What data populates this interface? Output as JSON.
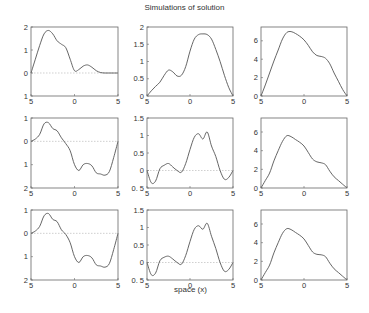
{
  "figure": {
    "title": "Simulations of solution",
    "xlabel": "space (x)",
    "line_color": "#555555",
    "axis_color": "#666666",
    "zero_line_color": "#bbbbbb"
  },
  "chart_data": [
    {
      "type": "line",
      "row": 0,
      "col": 0,
      "xlim": [
        -5,
        5
      ],
      "ylim": [
        -1,
        2
      ],
      "xticks": [
        -5,
        0,
        5
      ],
      "xtick_labels": [
        "5",
        "0",
        "5"
      ],
      "yticks": [
        -1,
        0,
        1,
        2
      ],
      "ytick_labels": [
        "1",
        "0",
        "1",
        "2"
      ],
      "zero_line": true,
      "x": [
        -5,
        -4.5,
        -4,
        -3.5,
        -3,
        -2.5,
        -2,
        -1.5,
        -1,
        -0.5,
        0,
        0.5,
        1,
        1.5,
        2,
        2.5,
        3,
        3.5,
        4,
        4.5,
        5
      ],
      "y": [
        0.0,
        0.6,
        1.2,
        1.7,
        1.85,
        1.7,
        1.4,
        1.25,
        1.1,
        0.6,
        0.1,
        0.15,
        0.3,
        0.35,
        0.25,
        0.1,
        0.02,
        0.0,
        0.0,
        0.0,
        0.0
      ]
    },
    {
      "type": "line",
      "row": 0,
      "col": 1,
      "xlim": [
        -5,
        5
      ],
      "ylim": [
        0,
        2
      ],
      "xticks": [
        -5,
        0,
        5
      ],
      "xtick_labels": [
        "5",
        "0",
        "5"
      ],
      "yticks": [
        0,
        0.5,
        1,
        1.5,
        2
      ],
      "ytick_labels": [
        "0",
        "0.5",
        "1",
        "1.5",
        "2"
      ],
      "zero_line": false,
      "x": [
        -5,
        -4.5,
        -4,
        -3.5,
        -3,
        -2.5,
        -2,
        -1.5,
        -1,
        -0.5,
        0,
        0.5,
        1,
        1.5,
        2,
        2.5,
        3,
        3.5,
        4,
        4.5,
        5
      ],
      "y": [
        0.0,
        0.15,
        0.28,
        0.4,
        0.6,
        0.75,
        0.7,
        0.58,
        0.6,
        0.85,
        1.3,
        1.65,
        1.78,
        1.8,
        1.78,
        1.65,
        1.35,
        1.0,
        0.6,
        0.25,
        0.0
      ]
    },
    {
      "type": "line",
      "row": 0,
      "col": 2,
      "xlim": [
        -5,
        5
      ],
      "ylim": [
        0,
        7.5
      ],
      "xticks": [
        -5,
        0,
        5
      ],
      "xtick_labels": [
        "5",
        "0",
        "5"
      ],
      "yticks": [
        0,
        2,
        4,
        6
      ],
      "ytick_labels": [
        "0",
        "2",
        "4",
        "6"
      ],
      "zero_line": false,
      "x": [
        -5,
        -4.5,
        -4,
        -3.5,
        -3,
        -2.5,
        -2,
        -1.5,
        -1,
        -0.5,
        0,
        0.5,
        1,
        1.5,
        2,
        2.5,
        3,
        3.5,
        4,
        4.5,
        5
      ],
      "y": [
        0.0,
        1.2,
        2.5,
        3.8,
        5.0,
        6.2,
        6.9,
        7.0,
        6.8,
        6.5,
        6.1,
        5.5,
        4.8,
        4.4,
        4.3,
        4.1,
        3.5,
        2.5,
        1.6,
        0.7,
        0.0
      ]
    },
    {
      "type": "line",
      "row": 1,
      "col": 0,
      "xlim": [
        -5,
        5
      ],
      "ylim": [
        -2,
        1
      ],
      "xticks": [
        -5,
        0,
        5
      ],
      "xtick_labels": [
        "5",
        "0",
        "5"
      ],
      "yticks": [
        -2,
        -1,
        0,
        1
      ],
      "ytick_labels": [
        "2",
        "1",
        "0",
        "1"
      ],
      "zero_line": true,
      "x": [
        -5,
        -4.5,
        -4,
        -3.5,
        -3,
        -2.5,
        -2,
        -1.5,
        -1,
        -0.5,
        0,
        0.5,
        1,
        1.5,
        2,
        2.5,
        3,
        3.5,
        4,
        4.5,
        5
      ],
      "y": [
        0.0,
        0.1,
        0.3,
        0.75,
        0.8,
        0.55,
        0.45,
        0.15,
        -0.1,
        -0.4,
        -1.0,
        -1.25,
        -1.0,
        -0.95,
        -1.05,
        -1.35,
        -1.4,
        -1.45,
        -1.3,
        -0.7,
        0.0
      ]
    },
    {
      "type": "line",
      "row": 1,
      "col": 1,
      "xlim": [
        -5,
        5
      ],
      "ylim": [
        -0.5,
        1.5
      ],
      "xticks": [
        -5,
        0,
        5
      ],
      "xtick_labels": [
        "5",
        "0",
        "5"
      ],
      "yticks": [
        -0.5,
        0,
        0.5,
        1,
        1.5
      ],
      "ytick_labels": [
        "0. 5",
        "0",
        "0.5",
        "1",
        "1.5"
      ],
      "zero_line": true,
      "x": [
        -5,
        -4.5,
        -4,
        -3.5,
        -3,
        -2.5,
        -2,
        -1.5,
        -1,
        -0.5,
        0,
        0.5,
        1,
        1.5,
        2,
        2.5,
        3,
        3.5,
        4,
        4.5,
        5
      ],
      "y": [
        0.0,
        -0.35,
        -0.3,
        0.05,
        0.15,
        0.2,
        0.1,
        0.0,
        -0.05,
        0.2,
        0.6,
        0.95,
        1.05,
        0.9,
        1.1,
        0.7,
        0.4,
        0.0,
        -0.25,
        -0.2,
        0.0
      ]
    },
    {
      "type": "line",
      "row": 1,
      "col": 2,
      "xlim": [
        -5,
        5
      ],
      "ylim": [
        0,
        7.5
      ],
      "xticks": [
        -5,
        0,
        5
      ],
      "xtick_labels": [
        "5",
        "0",
        "5"
      ],
      "yticks": [
        0,
        2,
        4,
        6
      ],
      "ytick_labels": [
        "0",
        "2",
        "4",
        "6"
      ],
      "zero_line": false,
      "x": [
        -5,
        -4.5,
        -4,
        -3.5,
        -3,
        -2.5,
        -2,
        -1.5,
        -1,
        -0.5,
        0,
        0.5,
        1,
        1.5,
        2,
        2.5,
        3,
        3.5,
        4,
        4.5,
        5
      ],
      "y": [
        0.0,
        0.8,
        1.6,
        2.9,
        4.0,
        5.0,
        5.6,
        5.5,
        5.2,
        4.9,
        4.5,
        3.8,
        3.1,
        2.8,
        2.7,
        2.5,
        1.8,
        1.2,
        0.8,
        0.4,
        0.0
      ]
    },
    {
      "type": "line",
      "row": 2,
      "col": 0,
      "xlim": [
        -5,
        5
      ],
      "ylim": [
        -2,
        1
      ],
      "xticks": [
        -5,
        0,
        5
      ],
      "xtick_labels": [
        "5",
        "0",
        "5"
      ],
      "yticks": [
        -2,
        -1,
        0,
        1
      ],
      "ytick_labels": [
        "2",
        "1",
        "0",
        "1"
      ],
      "zero_line": true,
      "x": [
        -5,
        -4.5,
        -4,
        -3.5,
        -3,
        -2.5,
        -2,
        -1.5,
        -1,
        -0.5,
        0,
        0.5,
        1,
        1.5,
        2,
        2.5,
        3,
        3.5,
        4,
        4.5,
        5
      ],
      "y": [
        0.0,
        0.1,
        0.3,
        0.75,
        0.85,
        0.6,
        0.5,
        0.15,
        -0.05,
        -0.4,
        -1.0,
        -1.25,
        -1.0,
        -0.95,
        -1.05,
        -1.35,
        -1.4,
        -1.45,
        -1.3,
        -0.7,
        0.0
      ]
    },
    {
      "type": "line",
      "row": 2,
      "col": 1,
      "xlim": [
        -5,
        5
      ],
      "ylim": [
        -0.5,
        1.5
      ],
      "xticks": [
        -5,
        0,
        5
      ],
      "xtick_labels": [
        "5",
        "0",
        "5"
      ],
      "yticks": [
        -0.5,
        0,
        0.5,
        1,
        1.5
      ],
      "ytick_labels": [
        "0. 5",
        "0",
        "0.5",
        "1",
        "1.5"
      ],
      "zero_line": true,
      "x": [
        -5,
        -4.5,
        -4,
        -3.5,
        -3,
        -2.5,
        -2,
        -1.5,
        -1,
        -0.5,
        0,
        0.5,
        1,
        1.5,
        2,
        2.5,
        3,
        3.5,
        4,
        4.5,
        5
      ],
      "y": [
        0.0,
        -0.35,
        -0.3,
        0.05,
        0.15,
        0.18,
        0.1,
        0.0,
        -0.05,
        0.2,
        0.6,
        0.95,
        1.05,
        0.95,
        1.12,
        0.75,
        0.4,
        0.0,
        -0.25,
        -0.2,
        0.0
      ]
    },
    {
      "type": "line",
      "row": 2,
      "col": 2,
      "xlim": [
        -5,
        5
      ],
      "ylim": [
        0,
        7.5
      ],
      "xticks": [
        -5,
        0,
        5
      ],
      "xtick_labels": [
        "5",
        "0",
        "5"
      ],
      "yticks": [
        0,
        2,
        4,
        6
      ],
      "ytick_labels": [
        "0",
        "2",
        "4",
        "6"
      ],
      "zero_line": false,
      "x": [
        -5,
        -4.5,
        -4,
        -3.5,
        -3,
        -2.5,
        -2,
        -1.5,
        -1,
        -0.5,
        0,
        0.5,
        1,
        1.5,
        2,
        2.5,
        3,
        3.5,
        4,
        4.5,
        5
      ],
      "y": [
        0.0,
        0.8,
        1.6,
        2.9,
        4.0,
        5.0,
        5.5,
        5.4,
        5.1,
        4.8,
        4.4,
        3.7,
        3.0,
        2.75,
        2.7,
        2.5,
        1.8,
        1.2,
        0.8,
        0.4,
        0.0
      ]
    }
  ],
  "layout": {
    "cols_x": [
      [
        31,
        118
      ],
      [
        147,
        233
      ],
      [
        261,
        347
      ]
    ],
    "rows_y": [
      [
        27,
        96
      ],
      [
        118,
        188
      ],
      [
        210,
        280
      ]
    ]
  }
}
